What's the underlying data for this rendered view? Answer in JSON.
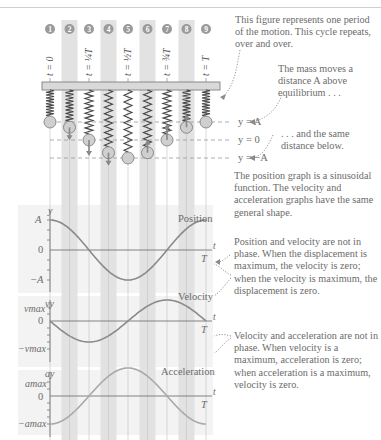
{
  "frames": [
    {
      "num": "1",
      "label": "t = 0"
    },
    {
      "num": "2",
      "label": ""
    },
    {
      "num": "3",
      "label": "t = ¼T"
    },
    {
      "num": "4",
      "label": ""
    },
    {
      "num": "5",
      "label": "t = ½T"
    },
    {
      "num": "6",
      "label": ""
    },
    {
      "num": "7",
      "label": "t = ¾T"
    },
    {
      "num": "8",
      "label": ""
    },
    {
      "num": "9",
      "label": "t = T"
    }
  ],
  "equilibrium_labels": {
    "top": "y = A",
    "middle": "y = 0",
    "bottom": "y = −A"
  },
  "annotations": {
    "period": "This figure represents one period of the motion. This cycle repeats, over and over.",
    "above": "The mass moves a distance A above equilibrium . . .",
    "below": ". . . and the same distance below.",
    "position_graph": "The position graph is a sinusoidal function. The velocity and acceleration graphs have the same general shape.",
    "pos_vel_phase": "Position and velocity are not in phase. When the displacement is maximum, the velocity is zero; when the velocity is maximum, the displacement is zero.",
    "vel_acc_phase": "Velocity and acceleration are not in phase. When velocity is a maximum, acceleration is zero; when acceleration is a maximum, velocity is zero."
  },
  "graphs": {
    "position": {
      "title": "Position",
      "ylabel": "y",
      "ymax": "A",
      "zero": "0",
      "ymin": "−A",
      "tlabel": "t",
      "tend": "T"
    },
    "velocity": {
      "title": "Velocity",
      "ylabel": "vy",
      "ymax": "vmax",
      "zero": "0",
      "ymin": "−vmax",
      "tlabel": "t",
      "tend": "T"
    },
    "acceleration": {
      "title": "Acceleration",
      "ylabel": "ay",
      "ymax": "amax",
      "zero": "0",
      "ymin": "−amax",
      "tlabel": "t",
      "tend": "T"
    }
  },
  "colors": {
    "curve": "#8a8a8a",
    "accel_curve": "#a9a9a9",
    "stripe": "#e2e2e2",
    "panel": "#f3f3f3",
    "text": "#6b6b6b"
  },
  "chart_data": [
    {
      "type": "line",
      "title": "Position",
      "xlabel": "t",
      "ylabel": "y",
      "x": [
        0,
        0.125,
        0.25,
        0.375,
        0.5,
        0.625,
        0.75,
        0.875,
        1
      ],
      "values": [
        1,
        0.707,
        0,
        -0.707,
        -1,
        -0.707,
        0,
        0.707,
        1
      ],
      "x_units": "T",
      "y_units": "A",
      "ylim": [
        -1,
        1
      ]
    },
    {
      "type": "line",
      "title": "Velocity",
      "xlabel": "t",
      "ylabel": "vy",
      "x": [
        0,
        0.125,
        0.25,
        0.375,
        0.5,
        0.625,
        0.75,
        0.875,
        1
      ],
      "values": [
        0,
        -0.707,
        -1,
        -0.707,
        0,
        0.707,
        1,
        0.707,
        0
      ],
      "x_units": "T",
      "y_units": "vmax",
      "ylim": [
        -1,
        1
      ]
    },
    {
      "type": "line",
      "title": "Acceleration",
      "xlabel": "t",
      "ylabel": "ay",
      "x": [
        0,
        0.125,
        0.25,
        0.375,
        0.5,
        0.625,
        0.75,
        0.875,
        1
      ],
      "values": [
        -1,
        -0.707,
        0,
        0.707,
        1,
        0.707,
        0,
        -0.707,
        -1
      ],
      "x_units": "T",
      "y_units": "amax",
      "ylim": [
        -1,
        1
      ]
    }
  ]
}
